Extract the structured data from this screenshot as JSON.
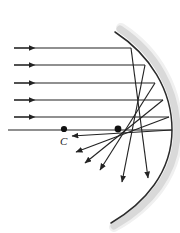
{
  "figure": {
    "name": "spherical-aberration-concave-mirror",
    "background_color": "#ffffff",
    "width": 180,
    "height": 233,
    "labels": {
      "center_of_curvature": "C"
    },
    "colors": {
      "ray_stroke": "#232323",
      "mirror_surface": "#2b2b2b",
      "mirror_band": "#d9d9d9",
      "dot_fill": "#111111"
    }
  },
  "chart_data": {
    "type": "scatter",
    "title": "",
    "xlabel": "",
    "ylabel": "",
    "xlim": [
      0,
      180
    ],
    "ylim": [
      233,
      0
    ],
    "grid": false,
    "legend": null,
    "mirror": {
      "name": "concave-mirror-arc",
      "shape": "circular-arc",
      "path": "M 115,32 C 150,55 172,90 172,130 C 172,172 145,203 111,223",
      "band_offset_path": "M 120,29 C 156,53 177,90 177,131 C 177,174 149,206 114,226",
      "stroke_width": 1.5
    },
    "principal_axis": {
      "name": "principal-axis",
      "x1": 8,
      "y1": 130,
      "x2": 172,
      "y2": 130
    },
    "center_of_curvature_point": {
      "x": 64,
      "y": 129,
      "label": "C"
    },
    "paraxial_crossing_point": {
      "x": 118,
      "y": 129
    },
    "incident_rays": [
      {
        "id": 1,
        "x1": 14,
        "y1": 48,
        "x2": 131,
        "y2": 48,
        "arrow_at": 80
      },
      {
        "id": 2,
        "x1": 14,
        "y1": 65,
        "x2": 145,
        "y2": 65,
        "arrow_at": 80
      },
      {
        "id": 3,
        "x1": 14,
        "y1": 83,
        "x2": 155,
        "y2": 83,
        "arrow_at": 80
      },
      {
        "id": 4,
        "x1": 14,
        "y1": 100,
        "x2": 163,
        "y2": 100,
        "arrow_at": 80
      },
      {
        "id": 5,
        "x1": 14,
        "y1": 117,
        "x2": 169,
        "y2": 117,
        "arrow_at": 80
      }
    ],
    "reflected_rays": [
      {
        "id": 1,
        "from_x": 131,
        "from_y": 48,
        "to_x": 148,
        "to_y": 178,
        "note": "outer-ray-steep-down-right"
      },
      {
        "id": 2,
        "from_x": 145,
        "from_y": 65,
        "to_x": 122,
        "to_y": 182,
        "note": "down-right"
      },
      {
        "id": 3,
        "from_x": 155,
        "from_y": 83,
        "to_x": 100,
        "to_y": 170,
        "note": "down-left-mid"
      },
      {
        "id": 4,
        "from_x": 163,
        "from_y": 100,
        "to_x": 85,
        "to_y": 163,
        "note": "down-left"
      },
      {
        "id": 5,
        "from_x": 169,
        "from_y": 117,
        "to_x": 76,
        "to_y": 152,
        "note": "shallow-down-left"
      },
      {
        "id": 6,
        "from_x": 172,
        "from_y": 130,
        "to_x": 72,
        "to_y": 136,
        "note": "axis-ray-back-to-C"
      }
    ],
    "annotation": "Parallel rays reflect from a spherical concave mirror and cross the axis at different points (spherical aberration). C marks the center of curvature."
  }
}
